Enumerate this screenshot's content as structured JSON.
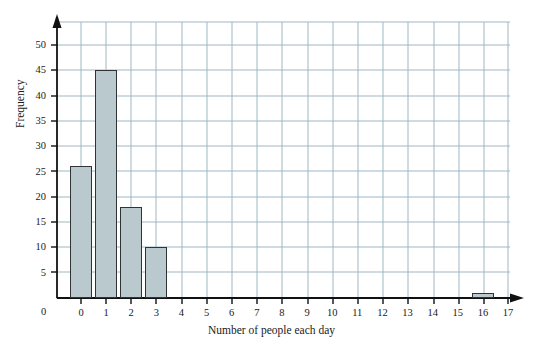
{
  "chart_data": {
    "type": "bar",
    "title": "",
    "xlabel": "Number of people each day",
    "ylabel": "Frequency",
    "categories": [
      0,
      1,
      2,
      3,
      4,
      5,
      6,
      7,
      8,
      9,
      10,
      11,
      12,
      13,
      14,
      15,
      16,
      17
    ],
    "values": [
      26,
      45,
      18,
      10,
      0,
      0,
      0,
      0,
      0,
      0,
      0,
      0,
      0,
      0,
      0,
      0,
      1,
      0
    ],
    "xlim": [
      0,
      17
    ],
    "ylim": [
      0,
      53
    ],
    "x_tick_labels": [
      "0",
      "1",
      "2",
      "3",
      "4",
      "5",
      "6",
      "7",
      "8",
      "9",
      "10",
      "11",
      "12",
      "13",
      "14",
      "15",
      "16",
      "17"
    ],
    "y_tick_labels": [
      "0",
      "5",
      "10",
      "15",
      "20",
      "25",
      "30",
      "35",
      "40",
      "45",
      "50"
    ],
    "y_ticks": [
      0,
      5,
      10,
      15,
      20,
      25,
      30,
      35,
      40,
      45,
      50
    ],
    "origin_label": "0",
    "grid": true,
    "grid_color": "#9fb6c4",
    "legend": null,
    "bar_fill_color": "#b9c9cd",
    "bar_edge_color": "#2e3436",
    "axis_color": "#111111",
    "background_color": "#ffffff",
    "annotations": []
  }
}
